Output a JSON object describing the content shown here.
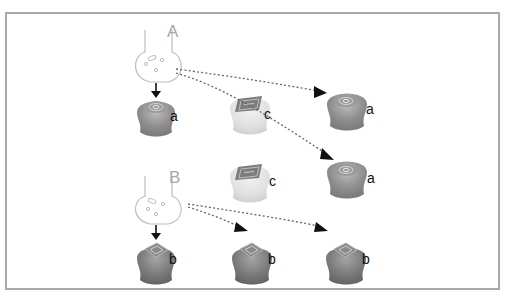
{
  "diagram": {
    "panels": [
      {
        "label": "A",
        "color": "#a8a8a8"
      },
      {
        "label": "B",
        "color": "#a8a8a8"
      }
    ],
    "cells": {
      "a": "a",
      "b": "b",
      "c": "c"
    },
    "colors": {
      "frame": "#a9a9a9",
      "cell_a": "#8c8c8c",
      "cell_b": "#7a7a7a",
      "cell_c": "#dedede",
      "arrow": "#111111",
      "squiggle": "#555555"
    }
  }
}
